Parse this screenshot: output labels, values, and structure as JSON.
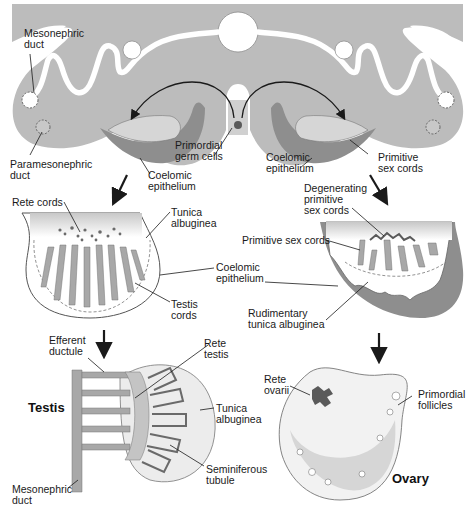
{
  "figure": {
    "colors": {
      "tissue_gray": "#b9b9b9",
      "dark_gray": "#8e8e8e",
      "cord_gray": "#a8a8a8",
      "duct_white": "#ffffff",
      "line": "#1a1a1a"
    }
  },
  "top_panel": {
    "labels": {
      "mesonephric_duct": "Mesonephric\nduct",
      "paramesonephric_duct": "Paramesonephric\nduct",
      "primordial_germ_cells": "Primordial\ngerm cells",
      "coelomic_epithelium_left": "Coelomic\nepithelium",
      "coelomic_epithelium_right": "Coelomic\nepithelium",
      "primitive_sex_cords": "Primitive\nsex cords"
    }
  },
  "testis_stage1": {
    "labels": {
      "rete_cords": "Rete cords",
      "tunica_albuginea": "Tunica\nalbuginea",
      "coelomic_epithelium": "Coelomic\nepithelium",
      "testis_cords": "Testis\ncords"
    }
  },
  "ovary_stage1": {
    "labels": {
      "degenerating_primitive_sex_cords": "Degenerating\nprimitive\nsex cords",
      "primitive_sex_cords": "Primitive sex cords",
      "rudimentary_tunica_albuginea": "Rudimentary\ntunica albuginea"
    }
  },
  "testis_final": {
    "title": "Testis",
    "labels": {
      "efferent_ductule": "Efferent\nductule",
      "rete_testis": "Rete\ntestis",
      "tunica_albuginea": "Tunica\nalbuginea",
      "seminiferous_tubule": "Seminiferous\ntubule",
      "mesonephric_duct": "Mesonephric\nduct"
    }
  },
  "ovary_final": {
    "title": "Ovary",
    "labels": {
      "rete_ovarii": "Rete\novarii",
      "primordial_follicles": "Primordial\nfollicles"
    }
  }
}
